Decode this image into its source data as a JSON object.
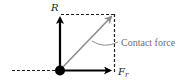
{
  "diagram": {
    "title": "",
    "labels": {
      "vertical_force": "R",
      "horizontal_force_main": "F",
      "horizontal_force_sub": "r",
      "resultant": "Contact force"
    },
    "colors": {
      "force_arrows": "#000000",
      "resultant_arrow": "#8c8c8c",
      "dashed_lines": "#222222",
      "label_text": "#1a1a1a",
      "annotation_text": "#6e6e6e"
    },
    "elements": [
      {
        "id": "point-of-contact",
        "type": "dot",
        "x": 60,
        "y": 70
      },
      {
        "id": "R-arrow",
        "type": "arrow",
        "from": [
          60,
          70
        ],
        "to": [
          60,
          14
        ],
        "label": "R"
      },
      {
        "id": "Fr-arrow",
        "type": "arrow",
        "from": [
          60,
          70
        ],
        "to": [
          114,
          70
        ],
        "label": "Fr"
      },
      {
        "id": "contact-force-arrow",
        "type": "arrow",
        "from": [
          60,
          70
        ],
        "to": [
          114,
          14
        ],
        "label": "Contact force"
      }
    ]
  }
}
